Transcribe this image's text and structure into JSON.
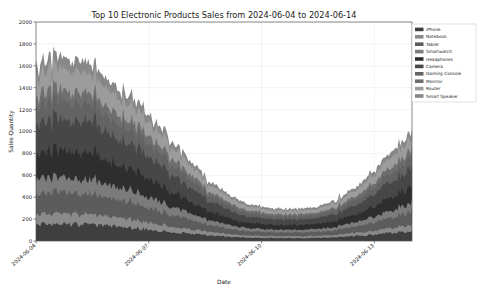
{
  "figure": {
    "width": 484,
    "height": 291,
    "background": "#ffffff",
    "border_color": "#b5b5b5"
  },
  "chart_data": {
    "type": "area",
    "stacked": true,
    "title": "Top 10 Electronic Products Sales from 2024-06-04 to 2024-06-14",
    "xlabel": "Date",
    "ylabel": "Sales Quantity",
    "grid": true,
    "legend_position": "upper right",
    "ylim": [
      0,
      2000
    ],
    "yticks": [
      0,
      200,
      400,
      600,
      800,
      1000,
      1200,
      1400,
      1600,
      1800,
      2000
    ],
    "ytick_labels": [
      "0",
      "200",
      "400",
      "600",
      "800",
      "1000",
      "1200",
      "1400",
      "1600",
      "1800",
      "2000"
    ],
    "xlim": [
      "2024-06-04",
      "2024-06-14"
    ],
    "xticks": [
      "2024-06-04",
      "2024-06-07",
      "2024-06-10",
      "2024-06-13"
    ],
    "xtick_labels": [
      "2024-06-04",
      "2024-06-07",
      "2024-06-10",
      "2024-06-13"
    ],
    "xtick_positions": [
      0.0,
      0.3,
      0.6,
      0.9
    ],
    "noise_amplitude": 0.16,
    "samples": 260,
    "series": [
      {
        "name": "iPhone",
        "color": "#3f3f3f",
        "envelope": [
          148,
          150,
          146,
          140,
          132,
          120,
          104,
          86,
          68,
          52,
          40,
          32,
          28,
          26,
          26,
          28,
          34,
          44,
          58,
          74,
          88
        ]
      },
      {
        "name": "Notebook",
        "color": "#8a8a8a",
        "envelope": [
          92,
          94,
          92,
          88,
          82,
          74,
          64,
          52,
          41,
          32,
          25,
          20,
          18,
          17,
          17,
          18,
          21,
          27,
          36,
          46,
          55
        ]
      },
      {
        "name": "Tablet",
        "color": "#5c5c5c",
        "envelope": [
          188,
          190,
          186,
          178,
          168,
          152,
          132,
          110,
          87,
          66,
          50,
          40,
          35,
          33,
          33,
          36,
          43,
          56,
          74,
          94,
          112
        ]
      },
      {
        "name": "Smartwatch",
        "color": "#7b7b7b",
        "envelope": [
          132,
          134,
          131,
          126,
          118,
          107,
          93,
          77,
          61,
          47,
          36,
          28,
          25,
          23,
          23,
          25,
          30,
          39,
          52,
          66,
          79
        ]
      },
      {
        "name": "Headphones",
        "color": "#2e2e2e",
        "envelope": [
          238,
          242,
          237,
          227,
          214,
          194,
          169,
          140,
          111,
          84,
          64,
          51,
          45,
          42,
          42,
          46,
          55,
          71,
          94,
          120,
          143
        ]
      },
      {
        "name": "Camera",
        "color": "#474747",
        "envelope": [
          276,
          280,
          274,
          263,
          248,
          225,
          196,
          163,
          129,
          98,
          74,
          59,
          52,
          49,
          49,
          53,
          63,
          82,
          109,
          139,
          166
        ]
      },
      {
        "name": "Gaming Console",
        "color": "#636363",
        "envelope": [
          158,
          160,
          157,
          151,
          142,
          129,
          112,
          93,
          74,
          56,
          43,
          34,
          30,
          28,
          28,
          30,
          36,
          47,
          62,
          80,
          95
        ]
      },
      {
        "name": "Monitor",
        "color": "#6e6e6e",
        "envelope": [
          104,
          106,
          104,
          100,
          94,
          85,
          74,
          62,
          49,
          37,
          28,
          22,
          20,
          19,
          19,
          20,
          24,
          31,
          41,
          53,
          63
        ]
      },
      {
        "name": "Router",
        "color": "#9c9c9c",
        "envelope": [
          182,
          185,
          181,
          174,
          163,
          148,
          129,
          107,
          85,
          64,
          49,
          39,
          34,
          32,
          32,
          35,
          42,
          54,
          72,
          92,
          110
        ]
      },
      {
        "name": "Smart Speaker",
        "color": "#878787",
        "envelope": [
          96,
          98,
          96,
          92,
          86,
          78,
          68,
          56,
          45,
          34,
          26,
          21,
          18,
          17,
          17,
          18,
          22,
          28,
          38,
          48,
          57
        ]
      }
    ]
  },
  "legend": {
    "items": [
      {
        "label": "iPhone",
        "color": "#3f3f3f"
      },
      {
        "label": "Notebook",
        "color": "#8a8a8a"
      },
      {
        "label": "Tablet",
        "color": "#5c5c5c"
      },
      {
        "label": "Smartwatch",
        "color": "#7b7b7b"
      },
      {
        "label": "Headphones",
        "color": "#2e2e2e"
      },
      {
        "label": "Camera",
        "color": "#474747"
      },
      {
        "label": "Gaming Console",
        "color": "#636363"
      },
      {
        "label": "Monitor",
        "color": "#6e6e6e"
      },
      {
        "label": "Router",
        "color": "#9c9c9c"
      },
      {
        "label": "Smart Speaker",
        "color": "#878787"
      }
    ]
  }
}
